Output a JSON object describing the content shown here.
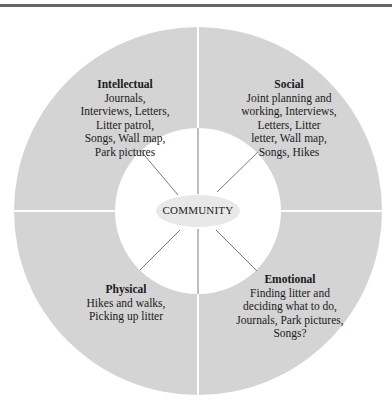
{
  "diagram": {
    "center": {
      "label": "COMMUNITY"
    },
    "quadrants": [
      {
        "id": "intellectual",
        "title": "Intellectual",
        "body": "Journals,\nInterviews, Letters,\nLitter patrol,\nSongs, Wall map,\nPark pictures"
      },
      {
        "id": "social",
        "title": "Social",
        "body": "Joint planning and\nworking, Interviews,\nLetters, Litter\nletter, Wall map,\nSongs, Hikes"
      },
      {
        "id": "physical",
        "title": "Physical",
        "body": "Hikes and walks,\nPicking up litter"
      },
      {
        "id": "emotional",
        "title": "Emotional",
        "body": "Finding litter and\ndeciding what to do,\nJournals, Park pictures,\nSongs?"
      }
    ],
    "colors": {
      "ring": "#d4d4d4",
      "inner": "#ffffff",
      "ellipse": "#e8e8e8",
      "spoke": "#7a7a7a",
      "rule": "#666666"
    }
  }
}
